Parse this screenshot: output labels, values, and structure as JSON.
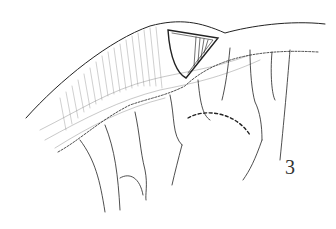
{
  "figure": {
    "label": "3",
    "ink_color": "#222222",
    "background": "#ffffff"
  }
}
